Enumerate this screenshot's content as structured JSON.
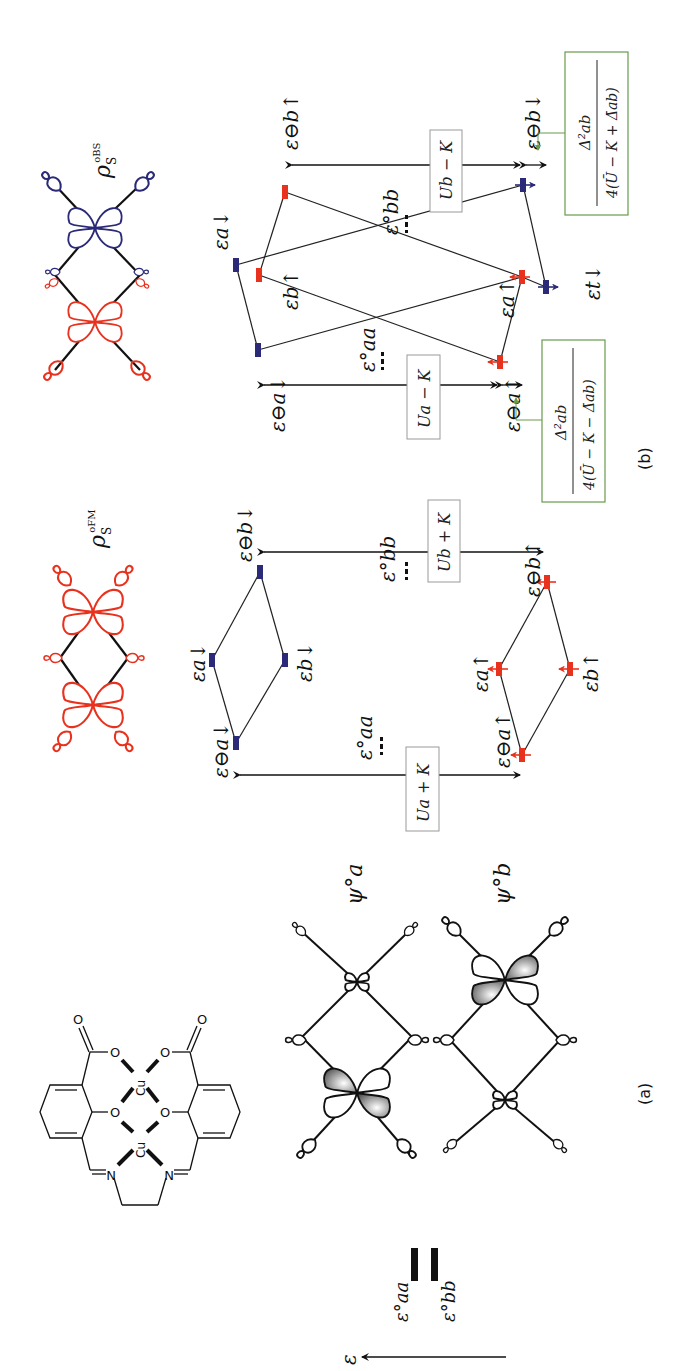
{
  "figure": {
    "panel_a_label": "(a)",
    "panel_b_label": "(b)",
    "energy_axis_label": "ε",
    "colors": {
      "spin_up": "#e8321e",
      "spin_down": "#2a2a78",
      "green_box": "#6a9a4a",
      "black": "#111111",
      "box_border": "#999999"
    }
  },
  "panel_a": {
    "molecule": {
      "metal_labels": [
        "Cu",
        "Cu"
      ],
      "atom_labels": [
        "O",
        "O",
        "O",
        "O",
        "O",
        "O",
        "N",
        "N"
      ]
    },
    "reference_levels": {
      "aa_label": "ε°aa",
      "bb_label": "ε°bb"
    },
    "orbitals": [
      {
        "label": "ψ°a"
      },
      {
        "label": "ψ°b"
      }
    ]
  },
  "panel_b": {
    "fm": {
      "density_label": "ρ",
      "density_sub": "S",
      "density_sup": "oFM",
      "levels": {
        "b_down_ref": "ε⊖b↓",
        "a_down": "εa↓",
        "b_down": "εb↓",
        "a_down_ref": "ε⊖a↓",
        "b_up_ref": "ε⊖b↑",
        "a_up": "εa↑",
        "b_up": "εb↑",
        "a_up_ref": "ε⊖a↑",
        "aa_ref": "ε°aa",
        "bb_ref": "ε°bb"
      },
      "gap_boxes": {
        "b": "Ub + K",
        "a": "Ua + K"
      }
    },
    "obs": {
      "density_label": "ρ",
      "density_sub": "S",
      "density_sup": "oBS",
      "levels": {
        "a_down": "εa↓",
        "b_up": "εb↑",
        "b_up_ref": "ε⊖b↑",
        "b_down_ref": "ε⊖b↓",
        "a_up": "εa↑",
        "t_down": "εt↓",
        "a_down_ref": "ε⊖a↓",
        "a_up_ref": "ε⊖a↑",
        "aa_ref": "ε°aa",
        "bb_ref": "ε°bb"
      },
      "gap_boxes": {
        "b": "Ub − K",
        "a": "Ua − K"
      },
      "shift_boxes": {
        "plus": {
          "numerator": "Δ²ab",
          "denominator": "4(Ū − K + Δ̄ab)"
        },
        "minus": {
          "numerator": "Δ²ab",
          "denominator": "4(Ū − K − Δ̄ab)"
        }
      }
    }
  }
}
